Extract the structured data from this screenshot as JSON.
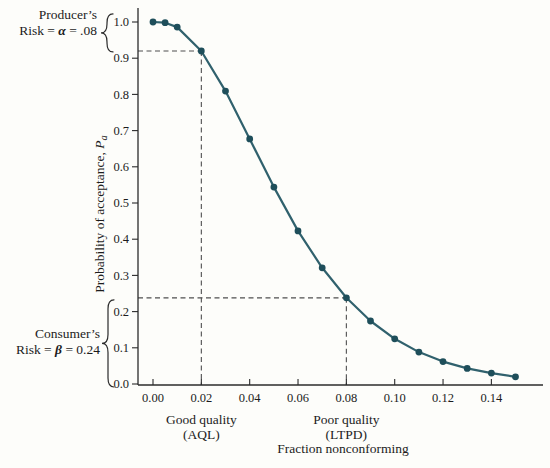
{
  "chart_data": {
    "type": "line",
    "x": [
      0.0,
      0.005,
      0.01,
      0.02,
      0.03,
      0.04,
      0.05,
      0.06,
      0.07,
      0.08,
      0.09,
      0.1,
      0.11,
      0.12,
      0.13,
      0.14,
      0.15
    ],
    "y": [
      1.0,
      0.998,
      0.986,
      0.92,
      0.809,
      0.677,
      0.544,
      0.423,
      0.321,
      0.238,
      0.174,
      0.125,
      0.088,
      0.062,
      0.043,
      0.03,
      0.02
    ],
    "xlabel": "Fraction nonconforming",
    "ylabel": "Probability of acceptance, Pa",
    "ylabel_prefix": "Probability of acceptance, ",
    "ylabel_symbol": "P",
    "ylabel_subscript": "a",
    "xlim": [
      0,
      0.157
    ],
    "ylim": [
      0,
      1.0
    ],
    "grid": "off",
    "marker": "circle",
    "x_ticks": {
      "values": [
        0.0,
        0.02,
        0.04,
        0.06,
        0.08,
        0.1,
        0.12,
        0.14
      ],
      "labels": [
        "0.00",
        "0.02",
        "0.04",
        "0.06",
        "0.08",
        "0.10",
        "0.12",
        "0.14"
      ]
    },
    "y_ticks": {
      "values": [
        0.0,
        0.1,
        0.2,
        0.3,
        0.4,
        0.5,
        0.6,
        0.7,
        0.8,
        0.9,
        1.0
      ],
      "labels": [
        "0.0",
        "0.1",
        "0.2",
        "0.3",
        "0.4",
        "0.5",
        "0.6",
        "0.7",
        "0.8",
        "0.9",
        "1.0"
      ]
    },
    "guides": [
      {
        "name": "producer-risk-guide",
        "x": 0.02,
        "y": 0.92
      },
      {
        "name": "consumer-risk-guide",
        "x": 0.08,
        "y": 0.238
      }
    ],
    "region_labels": [
      {
        "name": "aql-label",
        "x": 0.02,
        "line1": "Good quality",
        "line2": "(AQL)"
      },
      {
        "name": "ltpd-label",
        "x": 0.08,
        "line1": "Poor quality",
        "line2": "(LTPD)"
      }
    ],
    "colors": {
      "line": "#30616d",
      "marker": "#1e4e5a",
      "dashed": "#4f4f4f",
      "axis": "#2b2b2b",
      "text": "#1c1c1c",
      "background": "#fdfdfa"
    }
  },
  "annotations": {
    "producer": {
      "line1": "Producer’s",
      "line2_prefix": "Risk = ",
      "symbol": "α",
      "line2_suffix": " = .08"
    },
    "consumer": {
      "line1": "Consumer’s",
      "line2_prefix": "Risk = ",
      "symbol": "β",
      "line2_suffix": " = 0.24"
    }
  }
}
